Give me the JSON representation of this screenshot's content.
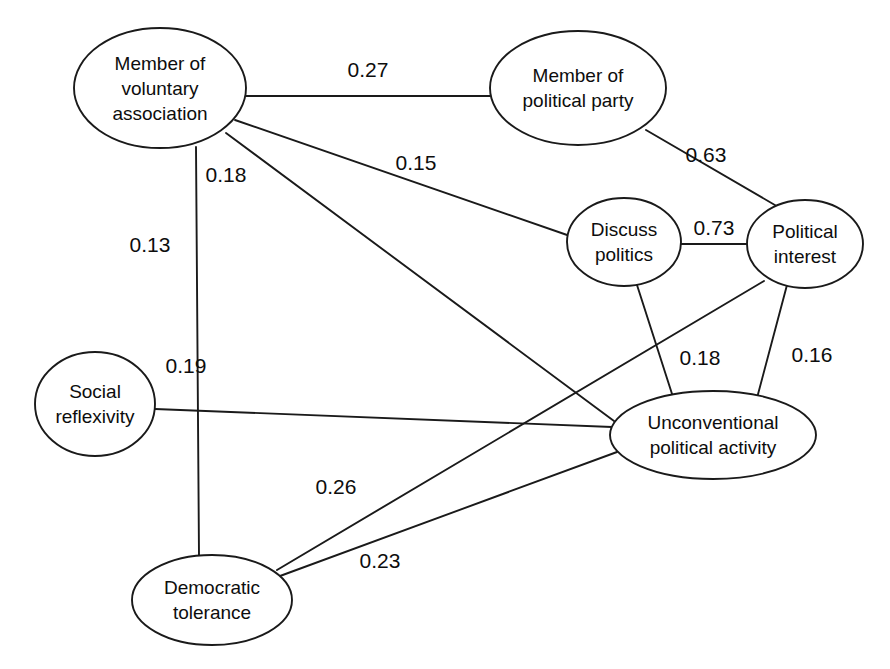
{
  "figure": {
    "caption_fragment": "",
    "type": "network-diagram",
    "background_color": "#ffffff",
    "line_color": "#1a1a1a",
    "text_color": "#0d0d0d",
    "width": 890,
    "height": 669
  },
  "chart_data": {
    "type": "network",
    "title": "",
    "xlabel": "",
    "ylabel": "",
    "legend": [],
    "nodes": [
      {
        "id": "voluntary_association",
        "label": "Member of\nvoluntary\nassociation",
        "label_lines": [
          "Member of",
          "voluntary",
          "association"
        ],
        "cx": 160,
        "cy": 88,
        "rx": 86,
        "ry": 60
      },
      {
        "id": "political_party",
        "label": "Member of\npolitical party",
        "label_lines": [
          "Member of",
          "political party"
        ],
        "cx": 578,
        "cy": 88,
        "rx": 88,
        "ry": 57
      },
      {
        "id": "discuss_politics",
        "label": "Discuss\npolitics",
        "label_lines": [
          "Discuss",
          "politics"
        ],
        "cx": 624,
        "cy": 242,
        "rx": 57,
        "ry": 44
      },
      {
        "id": "political_interest",
        "label": "Political\ninterest",
        "label_lines": [
          "Political",
          "interest"
        ],
        "cx": 805,
        "cy": 244,
        "rx": 58,
        "ry": 44
      },
      {
        "id": "social_reflexivity",
        "label": "Social\nreflexivity",
        "label_lines": [
          "Social",
          "reflexivity"
        ],
        "cx": 95,
        "cy": 404,
        "rx": 60,
        "ry": 52
      },
      {
        "id": "unconventional_political_activity",
        "label": "Unconventional\npolitical activity",
        "label_lines": [
          "Unconventional",
          "political activity"
        ],
        "cx": 713,
        "cy": 435,
        "rx": 103,
        "ry": 44
      },
      {
        "id": "democratic_tolerance",
        "label": "Democratic\ntolerance",
        "label_lines": [
          "Democratic",
          "tolerance"
        ],
        "cx": 212,
        "cy": 600,
        "rx": 80,
        "ry": 45
      }
    ],
    "edges": [
      {
        "source": "voluntary_association",
        "target": "political_party",
        "weight": "0.27",
        "x1": 246,
        "y1": 96,
        "x2": 490,
        "y2": 96,
        "label_x": 368,
        "label_y": 70
      },
      {
        "source": "voluntary_association",
        "target": "discuss_politics",
        "weight": "0.15",
        "x1": 235,
        "y1": 120,
        "x2": 570,
        "y2": 236,
        "label_x": 416,
        "label_y": 163
      },
      {
        "source": "voluntary_association",
        "target": "unconventional_political_activity",
        "weight": "0.18",
        "x1": 226,
        "y1": 133,
        "x2": 614,
        "y2": 421,
        "label_x": 226,
        "label_y": 175
      },
      {
        "source": "voluntary_association",
        "target": "democratic_tolerance",
        "weight": "0.13",
        "x1": 196,
        "y1": 147,
        "x2": 199,
        "y2": 556,
        "label_x": 150,
        "label_y": 245
      },
      {
        "source": "political_party",
        "target": "political_interest",
        "weight": "0.63",
        "x1": 646,
        "y1": 130,
        "x2": 780,
        "y2": 208,
        "label_x": 706,
        "label_y": 155
      },
      {
        "source": "discuss_politics",
        "target": "political_interest",
        "weight": "0.73",
        "x1": 681,
        "y1": 244,
        "x2": 747,
        "y2": 244,
        "label_x": 714,
        "label_y": 228
      },
      {
        "source": "discuss_politics",
        "target": "unconventional_political_activity",
        "weight": "0.18",
        "x1": 637,
        "y1": 285,
        "x2": 673,
        "y2": 397,
        "label_x": 700,
        "label_y": 358
      },
      {
        "source": "political_interest",
        "target": "unconventional_political_activity",
        "weight": "0.16",
        "x1": 787,
        "y1": 285,
        "x2": 757,
        "y2": 398,
        "label_x": 812,
        "label_y": 355
      },
      {
        "source": "democratic_tolerance",
        "target": "political_interest",
        "weight": "0.26",
        "x1": 277,
        "y1": 570,
        "x2": 764,
        "y2": 281,
        "label_x": 336,
        "label_y": 487
      },
      {
        "source": "social_reflexivity",
        "target": "unconventional_political_activity",
        "weight": "0.19",
        "x1": 155,
        "y1": 409,
        "x2": 612,
        "y2": 427,
        "label_x": 186,
        "label_y": 366
      },
      {
        "source": "democratic_tolerance",
        "target": "unconventional_political_activity",
        "weight": "0.23",
        "x1": 280,
        "y1": 576,
        "x2": 617,
        "y2": 452,
        "label_x": 380,
        "label_y": 561
      }
    ]
  }
}
